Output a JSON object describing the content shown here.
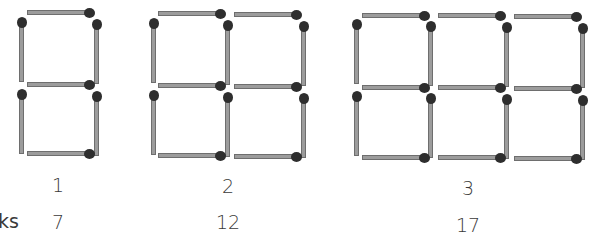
{
  "colors": {
    "stick": "#9c9c9c",
    "stick_border": "#6e6e6e",
    "head": "#2e2e2e",
    "text": "#3a3a3a"
  },
  "figures": [
    {
      "label": "1",
      "count": "7",
      "label_x": 58,
      "label_y": 176,
      "count_x": 58,
      "count_y": 213,
      "matches": [
        {
          "o": "h",
          "x": 27,
          "y": 12,
          "len": 63
        },
        {
          "o": "v",
          "x": 20,
          "y": 17,
          "len": 63
        },
        {
          "o": "v",
          "x": 95,
          "y": 19,
          "len": 63
        },
        {
          "o": "h",
          "x": 27,
          "y": 84,
          "len": 63
        },
        {
          "o": "v",
          "x": 20,
          "y": 89,
          "len": 63
        },
        {
          "o": "v",
          "x": 95,
          "y": 91,
          "len": 63
        },
        {
          "o": "h",
          "x": 27,
          "y": 153,
          "len": 63
        }
      ]
    },
    {
      "label": "2",
      "count": "12",
      "label_x": 228,
      "label_y": 177,
      "count_x": 228,
      "count_y": 213,
      "matches": [
        {
          "o": "h",
          "x": 158,
          "y": 13,
          "len": 63
        },
        {
          "o": "h",
          "x": 234,
          "y": 14,
          "len": 63
        },
        {
          "o": "v",
          "x": 152,
          "y": 18,
          "len": 63
        },
        {
          "o": "v",
          "x": 226,
          "y": 20,
          "len": 63
        },
        {
          "o": "v",
          "x": 302,
          "y": 21,
          "len": 63
        },
        {
          "o": "h",
          "x": 158,
          "y": 85,
          "len": 63
        },
        {
          "o": "h",
          "x": 234,
          "y": 86,
          "len": 63
        },
        {
          "o": "v",
          "x": 152,
          "y": 90,
          "len": 63
        },
        {
          "o": "v",
          "x": 226,
          "y": 92,
          "len": 63
        },
        {
          "o": "v",
          "x": 302,
          "y": 93,
          "len": 63
        },
        {
          "o": "h",
          "x": 158,
          "y": 155,
          "len": 63
        },
        {
          "o": "h",
          "x": 234,
          "y": 156,
          "len": 63
        }
      ]
    },
    {
      "label": "3",
      "count": "17",
      "label_x": 468,
      "label_y": 179,
      "count_x": 468,
      "count_y": 216,
      "matches": [
        {
          "o": "h",
          "x": 362,
          "y": 15,
          "len": 63
        },
        {
          "o": "h",
          "x": 438,
          "y": 15,
          "len": 63
        },
        {
          "o": "h",
          "x": 514,
          "y": 16,
          "len": 63
        },
        {
          "o": "v",
          "x": 355,
          "y": 19,
          "len": 63
        },
        {
          "o": "v",
          "x": 429,
          "y": 21,
          "len": 63
        },
        {
          "o": "v",
          "x": 505,
          "y": 22,
          "len": 63
        },
        {
          "o": "v",
          "x": 581,
          "y": 23,
          "len": 63
        },
        {
          "o": "h",
          "x": 362,
          "y": 87,
          "len": 63
        },
        {
          "o": "h",
          "x": 438,
          "y": 87,
          "len": 63
        },
        {
          "o": "h",
          "x": 514,
          "y": 88,
          "len": 63
        },
        {
          "o": "v",
          "x": 355,
          "y": 91,
          "len": 63
        },
        {
          "o": "v",
          "x": 429,
          "y": 93,
          "len": 63
        },
        {
          "o": "v",
          "x": 505,
          "y": 94,
          "len": 63
        },
        {
          "o": "v",
          "x": 581,
          "y": 95,
          "len": 63
        },
        {
          "o": "h",
          "x": 362,
          "y": 157,
          "len": 63
        },
        {
          "o": "h",
          "x": 438,
          "y": 157,
          "len": 63
        },
        {
          "o": "h",
          "x": 514,
          "y": 158,
          "len": 63
        }
      ]
    }
  ],
  "row_label": "ks"
}
